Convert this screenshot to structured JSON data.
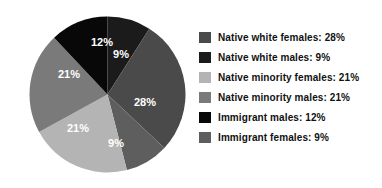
{
  "chart_data": {
    "type": "pie",
    "title": "",
    "subtitle": "",
    "xlabel": "",
    "ylabel": "",
    "grid": false,
    "legend_position": "right",
    "start_angle_deg": 0,
    "direction": "clockwise",
    "categories": [
      "Native white females",
      "Native white males",
      "Native minority females",
      "Native minority males",
      "Immigrant males",
      "Immigrant females"
    ],
    "values": [
      28,
      9,
      21,
      21,
      12,
      9
    ],
    "value_unit": "%",
    "colors": [
      "#4a4a4a",
      "#1b1b1b",
      "#b4b4b4",
      "#7a7a7a",
      "#080808",
      "#5e5e5e"
    ],
    "slices": [
      {
        "label": "Native white females",
        "value": 28,
        "display": "28%",
        "color": "#4a4a4a",
        "legend_text": "Native white females: 28%"
      },
      {
        "label": "Native white males",
        "value": 9,
        "display": "9%",
        "color": "#1b1b1b",
        "legend_text": "Native white males: 9%"
      },
      {
        "label": "Native minority females",
        "value": 21,
        "display": "21%",
        "color": "#b4b4b4",
        "legend_text": "Native minority females: 21%"
      },
      {
        "label": "Native minority males",
        "value": 21,
        "display": "21%",
        "color": "#7a7a7a",
        "legend_text": "Native minority males: 21%"
      },
      {
        "label": "Immigrant males",
        "value": 12,
        "display": "12%",
        "color": "#080808",
        "legend_text": "Immigrant males: 12%"
      },
      {
        "label": "Immigrant females",
        "value": 9,
        "display": "9%",
        "color": "#5e5e5e",
        "legend_text": "Immigrant females: 9%"
      }
    ],
    "draw_order": [
      {
        "key": "native-white-males",
        "display": "9%",
        "color": "#1b1b1b",
        "value": 9,
        "label_x": 92,
        "label_y": 42
      },
      {
        "key": "native-white-females",
        "display": "28%",
        "color": "#4a4a4a",
        "value": 28,
        "label_x": 116,
        "label_y": 90
      },
      {
        "key": "immigrant-females",
        "display": "9%",
        "color": "#5e5e5e",
        "value": 9,
        "label_x": 87,
        "label_y": 131
      },
      {
        "key": "native-minority-females",
        "display": "21%",
        "color": "#b4b4b4",
        "value": 21,
        "label_x": 49,
        "label_y": 116
      },
      {
        "key": "native-minority-males",
        "display": "21%",
        "color": "#7a7a7a",
        "value": 21,
        "label_x": 40,
        "label_y": 62
      },
      {
        "key": "immigrant-males",
        "display": "12%",
        "color": "#080808",
        "value": 12,
        "label_x": 73,
        "label_y": 30
      }
    ]
  },
  "pie": {
    "labels": {
      "native_white_males": "9%",
      "native_white_females": "28%",
      "immigrant_females": "9%",
      "native_minority_females": "21%",
      "native_minority_males": "21%",
      "immigrant_males": "12%"
    }
  },
  "legend": {
    "items": [
      {
        "text": "Native white females: 28%",
        "color": "#4a4a4a"
      },
      {
        "text": "Native white males: 9%",
        "color": "#1b1b1b"
      },
      {
        "text": "Native minority females: 21%",
        "color": "#b4b4b4"
      },
      {
        "text": "Native minority males: 21%",
        "color": "#7a7a7a"
      },
      {
        "text": "Immigrant males: 12%",
        "color": "#080808"
      },
      {
        "text": "Immigrant females: 9%",
        "color": "#5e5e5e"
      }
    ]
  }
}
